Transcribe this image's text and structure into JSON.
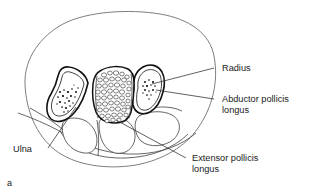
{
  "figure": {
    "caption": "a",
    "kind": "anatomical-cross-section",
    "region": "distal forearm transverse section",
    "background_color": "#ffffff",
    "ink_color": "#111111",
    "outline_color": "#6e6e6e"
  },
  "labels": {
    "radius": "Radius",
    "abductor_line1": "Abductor pollicis",
    "abductor_line2": "longus",
    "ulna": "Ulna",
    "extensor_line1": "Extensor pollicis",
    "extensor_line2": "longus"
  },
  "structures": [
    {
      "name": "skin-outline",
      "label": ""
    },
    {
      "name": "ulna-bone",
      "label": "Ulna"
    },
    {
      "name": "radius-bone",
      "label": "Radius"
    },
    {
      "name": "cancellous-bone",
      "label": ""
    },
    {
      "name": "abductor-pollicis-longus-tendon",
      "label": "Abductor pollicis longus"
    },
    {
      "name": "extensor-pollicis-longus-tendon",
      "label": "Extensor pollicis longus"
    }
  ]
}
